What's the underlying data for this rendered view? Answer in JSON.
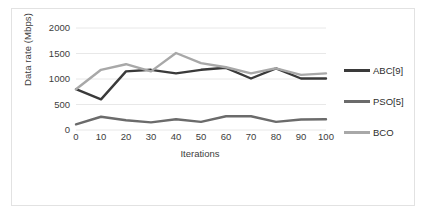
{
  "chart_data": {
    "type": "line",
    "title": "",
    "xlabel": "Iterations",
    "ylabel": "Data rate (Mbps)",
    "categories": [
      0,
      10,
      20,
      30,
      40,
      50,
      60,
      70,
      80,
      90,
      100
    ],
    "x": [
      0,
      10,
      20,
      30,
      40,
      50,
      60,
      70,
      80,
      90,
      100
    ],
    "xlim": [
      0,
      100
    ],
    "ylim": [
      0,
      2000
    ],
    "yticks": [
      0,
      500,
      1000,
      1500,
      2000
    ],
    "xticks": [
      0,
      10,
      20,
      30,
      40,
      50,
      60,
      70,
      80,
      90,
      100
    ],
    "grid": "horizontal",
    "legend_position": "right",
    "series": [
      {
        "name": "ABC[9]",
        "color": "#3a3a3a",
        "values": [
          800,
          600,
          1150,
          1180,
          1110,
          1180,
          1220,
          1010,
          1210,
          1010,
          1010
        ]
      },
      {
        "name": "PSO[5]",
        "color": "#6b6b6b",
        "values": [
          110,
          260,
          190,
          150,
          210,
          160,
          270,
          270,
          160,
          205,
          210
        ]
      },
      {
        "name": "BCO",
        "color": "#a8a8a8",
        "values": [
          800,
          1180,
          1290,
          1150,
          1510,
          1310,
          1230,
          1110,
          1210,
          1080,
          1110
        ]
      }
    ]
  },
  "legend": {
    "items": [
      {
        "label": "ABC[9]",
        "color": "#3a3a3a"
      },
      {
        "label": "PSO[5]",
        "color": "#6b6b6b"
      },
      {
        "label": "BCO",
        "color": "#a8a8a8"
      }
    ]
  },
  "axes": {
    "y_title": "Data rate (Mbps)",
    "x_title": "Iterations",
    "y_tick_labels": [
      "2000",
      "1500",
      "1000",
      "500",
      "0"
    ],
    "x_tick_labels": [
      "0",
      "10",
      "20",
      "30",
      "40",
      "50",
      "60",
      "70",
      "80",
      "90",
      "100"
    ]
  },
  "style": {
    "gridline_color": "#e8e8e8",
    "border_color": "#e2e2e2",
    "background": "#ffffff",
    "text_color": "#3d3d3d"
  }
}
